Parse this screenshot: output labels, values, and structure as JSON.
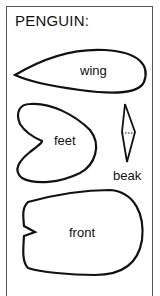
{
  "title": "PENGUIN:",
  "pieces": [
    {
      "id": "wing",
      "label": "wing"
    },
    {
      "id": "feet",
      "label": "feet"
    },
    {
      "id": "beak",
      "label": "beak"
    },
    {
      "id": "front",
      "label": "front"
    }
  ],
  "colors": {
    "stroke": "#111111",
    "frame": "#555555",
    "background": "#ffffff"
  }
}
